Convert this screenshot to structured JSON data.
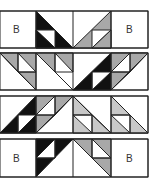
{
  "diagram": {
    "type": "quilt-block-layout",
    "rows": 4,
    "columns": 4,
    "colors": {
      "dark": "#111111",
      "medium": "#a8a8a8",
      "light": "#ffffff",
      "line": "#222222"
    },
    "label_B": "B",
    "row_labels": [
      {
        "left": "B",
        "right": "B"
      },
      {},
      {},
      {
        "left": "B",
        "right": "B"
      }
    ]
  }
}
